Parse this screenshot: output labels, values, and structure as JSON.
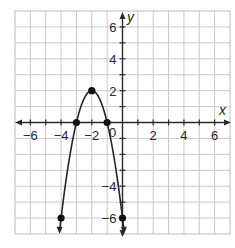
{
  "chart_data": {
    "type": "line",
    "title": "",
    "function": "y = -2(x + 2)^2 + 2",
    "xlabel": "x",
    "ylabel": "y",
    "xlim": [
      -7,
      7
    ],
    "ylim": [
      -7,
      7
    ],
    "grid": true,
    "grid_step": 1,
    "x_tick_labels": [
      "-6",
      "-4",
      "-2",
      "2",
      "4",
      "6"
    ],
    "x_tick_values": [
      -6,
      -4,
      -2,
      2,
      4,
      6
    ],
    "y_tick_labels": [
      "6",
      "4",
      "2",
      "-4",
      "-6"
    ],
    "y_tick_values": [
      6,
      4,
      2,
      -4,
      -6
    ],
    "origin_label": "0",
    "series": [
      {
        "name": "parabola",
        "points": [
          {
            "x": -4,
            "y": -6
          },
          {
            "x": -3,
            "y": 0
          },
          {
            "x": -2,
            "y": 2
          },
          {
            "x": -1,
            "y": 0
          },
          {
            "x": 0,
            "y": -6
          }
        ],
        "vertex": {
          "x": -2,
          "y": 2
        },
        "x_intercepts": [
          -3,
          -1
        ],
        "arrows_at_ends": true,
        "color": "#262626"
      }
    ],
    "legend": null
  }
}
